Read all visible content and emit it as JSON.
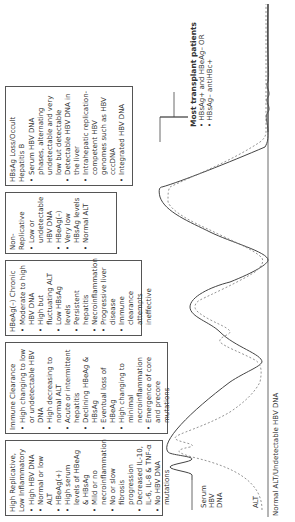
{
  "phases": [
    {
      "title": "High Replicative, Low Inflammatory",
      "bullets": [
        "High HBV DNA",
        "Normal or low ALT",
        "HBeAg(+)",
        "High serum levels of HBeAg & HBsAg",
        "Mild or no necroinflammation",
        "No or slow fibrosis progression",
        "Decreased IL-10, IL-6, IL-8 & TNF-α",
        "No HBV DNA mutations"
      ]
    },
    {
      "title": "Immune Clearance",
      "bullets": [
        "High changing to low or undetectable HBV DNA",
        "High decreasing to normal ALT",
        "Acute or intermittent hepatitis",
        "Declining HBeAg & HBsAg",
        "Eventual loss of HBeAg",
        "High changing to minimal necroinflammation",
        "Emergence of core and precore mutations"
      ]
    },
    {
      "title": "HBeAg(–) Chronic",
      "bullets": [
        "Moderate to high HBV DNA",
        "High but fluctuating ALT",
        "Low HBsAg levels",
        "Persistent hepatitis",
        "Necroinflammation",
        "Progressive liver disease",
        "Immune clearance attempts ineffective"
      ]
    },
    {
      "title": "Non-Replicative",
      "bullets": [
        "Low or undetectable HBV DNA",
        "HBeAg(–)",
        "Very low HBsAg levels",
        "Normal ALT"
      ]
    },
    {
      "title": "HBsAg Loss/Occult Hepatitis B",
      "bullets": [
        "Serum HBV DNA phases, alternating undetectable and very low but detectable",
        "Detectable HBV DNA in the liver",
        "Intrahepatic replication-competent HBV genomes such as HBV cccDNA",
        "Integrated HBV DNA"
      ]
    }
  ],
  "transplant": {
    "title": "Most transplant patients",
    "bullets": [
      "HBsAg+ and HBeAg– OR",
      "HBsAg– antiHBc+"
    ]
  },
  "curve_labels": {
    "serum": "Serum HBV DNA",
    "alt": "ALT",
    "baseline": "Normal ALT/Undetectable HBV DNA"
  }
}
